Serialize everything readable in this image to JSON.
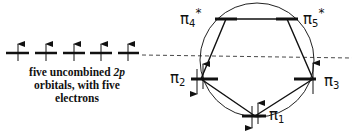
{
  "caption": {
    "line1_prefix": "five uncombined ",
    "line1_italic": "2p",
    "line2": "orbitals, with five",
    "line3": "electrons"
  },
  "left_orbitals": {
    "count": 5,
    "electrons": [
      "up",
      "up",
      "up",
      "up",
      "up"
    ]
  },
  "mo_levels": [
    {
      "symbol": "π",
      "index": "1",
      "star": "",
      "electrons": "paired"
    },
    {
      "symbol": "π",
      "index": "2",
      "star": "",
      "electrons": "paired"
    },
    {
      "symbol": "π",
      "index": "3",
      "star": "",
      "electrons": "up"
    },
    {
      "symbol": "π",
      "index": "4",
      "star": "*",
      "electrons": "none"
    },
    {
      "symbol": "π",
      "index": "5",
      "star": "*",
      "electrons": "none"
    }
  ],
  "labels": {
    "pi1": {
      "sym": "π",
      "sub": "1"
    },
    "pi2": {
      "sym": "π",
      "sub": "2"
    },
    "pi3": {
      "sym": "π",
      "sub": "3"
    },
    "pi4": {
      "sym": "π",
      "sub": "4",
      "star": "*"
    },
    "pi5": {
      "sym": "π",
      "sub": "5",
      "star": "*"
    }
  },
  "colors": {
    "ink": "#111111",
    "background": "#ffffff"
  }
}
